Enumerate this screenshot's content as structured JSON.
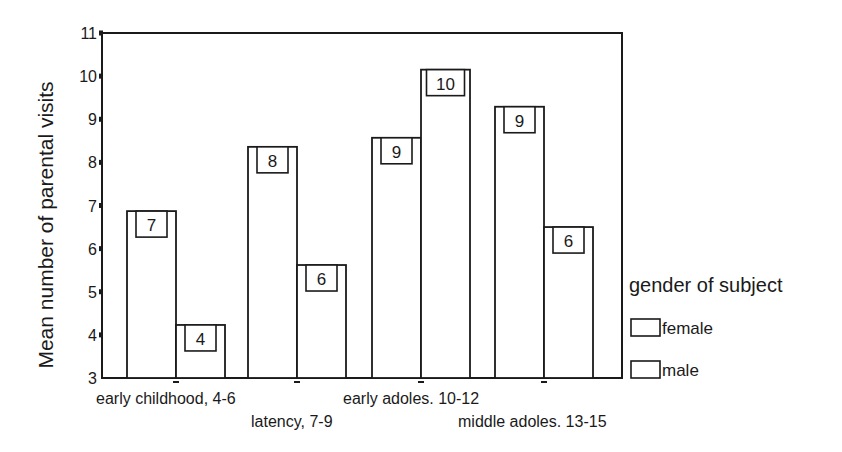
{
  "chart_data": {
    "type": "bar",
    "title": "",
    "xlabel": "",
    "ylabel": "Mean number of parental visits",
    "ylim": [
      3,
      11
    ],
    "yticks": [
      3,
      4,
      5,
      6,
      7,
      8,
      9,
      10,
      11
    ],
    "grid": false,
    "categories": [
      "early childhood, 4-6",
      "latency, 7-9",
      "early adoles. 10-12",
      "middle adoles. 13-15"
    ],
    "series": [
      {
        "name": "female",
        "values": [
          6.87,
          8.36,
          8.57,
          9.29
        ],
        "labels": [
          "7",
          "8",
          "9",
          "9"
        ],
        "fill": "#ffffff"
      },
      {
        "name": "male",
        "values": [
          4.23,
          5.62,
          10.15,
          6.5
        ],
        "labels": [
          "4",
          "6",
          "10",
          "6"
        ],
        "fill": "#ffffff"
      }
    ],
    "legend": {
      "title": "gender of subject",
      "position": "right",
      "entries": [
        "female",
        "male"
      ]
    },
    "colors": {
      "stroke": "#1a1a1a",
      "background": "#ffffff"
    }
  }
}
